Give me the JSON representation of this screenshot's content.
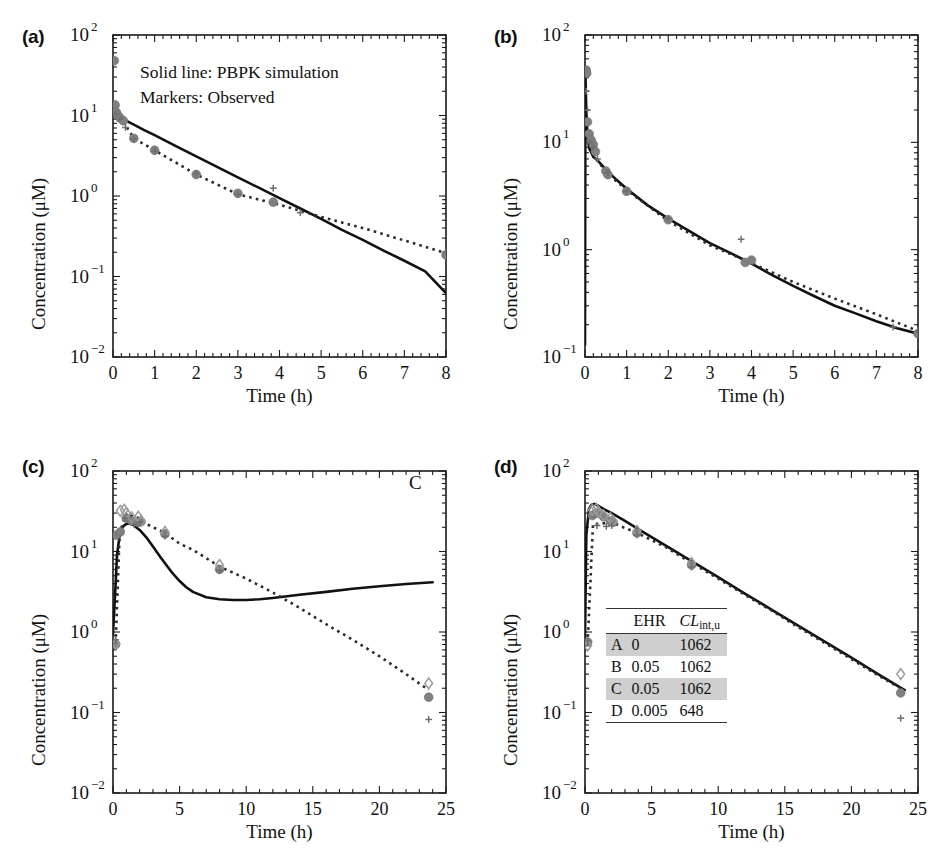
{
  "figure": {
    "panels": [
      {
        "id": "a",
        "label": "(a)",
        "xlabel": "Time (h)",
        "ylabel": "Concentration (μM)",
        "xlim": [
          0,
          8
        ],
        "ylim_exp": [
          -2,
          2
        ],
        "xticks": [
          0,
          1,
          2,
          3,
          4,
          5,
          6,
          7,
          8
        ],
        "xticklabels": [
          "0",
          "1",
          "2",
          "3",
          "4",
          "5",
          "6",
          "7",
          "8"
        ],
        "yticklabels": [
          "10⁻²",
          "10⁻¹",
          "10⁰",
          "10¹",
          "10²"
        ],
        "legend": [
          "Solid line: PBPK simulation",
          "Markers: Observed"
        ],
        "annotation": ""
      },
      {
        "id": "b",
        "label": "(b)",
        "xlabel": "Time (h)",
        "ylabel": "Concentration (μM)",
        "xlim": [
          0,
          8
        ],
        "ylim_exp": [
          -1,
          2
        ],
        "xticks": [
          0,
          1,
          2,
          3,
          4,
          5,
          6,
          7,
          8
        ],
        "xticklabels": [
          "0",
          "1",
          "2",
          "3",
          "4",
          "5",
          "6",
          "7",
          "8"
        ],
        "yticklabels": [
          "10⁻¹",
          "10⁰",
          "10¹",
          "10²"
        ],
        "legend": [],
        "annotation": ""
      },
      {
        "id": "c",
        "label": "(c)",
        "xlabel": "Time (h)",
        "ylabel": "Concentration (μM)",
        "xlim": [
          0,
          25
        ],
        "ylim_exp": [
          -2,
          2
        ],
        "xticks": [
          0,
          5,
          10,
          15,
          20,
          25
        ],
        "xticklabels": [
          "0",
          "5",
          "10",
          "15",
          "20",
          "25"
        ],
        "yticklabels": [
          "10⁻²",
          "10⁻¹",
          "10⁰",
          "10¹",
          "10²"
        ],
        "legend": [],
        "annotation": "C"
      },
      {
        "id": "d",
        "label": "(d)",
        "xlabel": "Time (h)",
        "ylabel": "Concentration (μM)",
        "xlim": [
          0,
          25
        ],
        "ylim_exp": [
          -2,
          2
        ],
        "xticks": [
          0,
          5,
          10,
          15,
          20,
          25
        ],
        "xticklabels": [
          "0",
          "5",
          "10",
          "15",
          "20",
          "25"
        ],
        "yticklabels": [
          "10⁻²",
          "10⁻¹",
          "10⁰",
          "10¹",
          "10²"
        ],
        "legend": [],
        "annotation": ""
      }
    ],
    "inset_table": {
      "columns": [
        "",
        "EHR",
        "CL_int,u"
      ],
      "col_headers": {
        "c1": "",
        "c2": "EHR",
        "c3_main": "CL",
        "c3_sub": "int,u"
      },
      "rows": [
        {
          "name": "A",
          "ehr": "0",
          "clintu": "1062",
          "shaded": true
        },
        {
          "name": "B",
          "ehr": "0.05",
          "clintu": "1062",
          "shaded": false
        },
        {
          "name": "C",
          "ehr": "0.05",
          "clintu": "1062",
          "shaded": true
        },
        {
          "name": "D",
          "ehr": "0.005",
          "clintu": "648",
          "shaded": false
        }
      ]
    },
    "colors": {
      "solid_line": "#111111",
      "dotted_line": "#2b2b2b",
      "marker_circle": "#808080",
      "marker_diamond": "#9a9a9a",
      "marker_plus": "#6e6e6e",
      "axis": "#1a1a1a",
      "table_shade": "#cfcfcf"
    }
  },
  "chart_data": [
    {
      "type": "line",
      "panel": "a",
      "title": "(a)",
      "xlabel": "Time (h)",
      "ylabel": "Concentration (μM)",
      "xlim": [
        0,
        8
      ],
      "ylim": [
        0.01,
        100
      ],
      "yscale": "log",
      "grid": false,
      "legend": [
        "Solid line: PBPK simulation",
        "Markers: Observed"
      ],
      "series": [
        {
          "name": "PBPK simulation (solid line)",
          "style": "solid",
          "x": [
            0,
            0.02,
            0.05,
            0.1,
            0.2,
            0.3,
            0.5,
            0.75,
            1,
            1.5,
            2,
            2.5,
            3,
            3.5,
            4,
            4.5,
            5,
            5.5,
            6,
            6.5,
            7,
            7.5,
            8
          ],
          "y": [
            11.0,
            10.6,
            10.2,
            9.8,
            9.2,
            8.7,
            7.7,
            6.6,
            5.7,
            4.2,
            3.1,
            2.3,
            1.7,
            1.27,
            0.94,
            0.7,
            0.52,
            0.38,
            0.285,
            0.21,
            0.157,
            0.116,
            0.062
          ]
        },
        {
          "name": "Observed trend (dotted line)",
          "style": "dotted",
          "x": [
            0.25,
            0.5,
            1,
            2,
            3,
            4,
            5,
            6,
            7,
            8
          ],
          "y": [
            8.4,
            5.2,
            3.7,
            1.85,
            1.05,
            0.78,
            0.55,
            0.4,
            0.28,
            0.195
          ]
        },
        {
          "name": "Observed (circle markers)",
          "style": "markers",
          "marker": "circle",
          "x": [
            0.03,
            0.05,
            0.08,
            0.12,
            0.17,
            0.25,
            0.5,
            1.0,
            2.0,
            3.0,
            3.85,
            8.0
          ],
          "y": [
            48.0,
            13.5,
            11.0,
            10.0,
            9.3,
            8.6,
            5.2,
            3.7,
            1.85,
            1.08,
            0.84,
            0.185
          ]
        },
        {
          "name": "Observed (plus markers)",
          "style": "markers",
          "marker": "plus",
          "x": [
            0.08,
            0.17,
            0.3,
            0.5,
            1.0,
            2.0,
            3.0,
            3.85,
            4.5,
            8.0
          ],
          "y": [
            10.5,
            9.1,
            7.1,
            5.1,
            3.6,
            1.9,
            1.05,
            1.25,
            0.62,
            0.2
          ]
        }
      ]
    },
    {
      "type": "line",
      "panel": "b",
      "title": "(b)",
      "xlabel": "Time (h)",
      "ylabel": "Concentration (μM)",
      "xlim": [
        0,
        8
      ],
      "ylim": [
        0.1,
        100
      ],
      "yscale": "log",
      "grid": false,
      "legend": [],
      "series": [
        {
          "name": "PBPK simulation (solid line)",
          "style": "solid",
          "x": [
            0,
            0.01,
            0.03,
            0.06,
            0.1,
            0.2,
            0.3,
            0.5,
            0.75,
            1,
            1.5,
            2,
            2.5,
            3,
            3.5,
            4,
            4.5,
            5,
            5.5,
            6,
            6.5,
            7,
            7.5,
            8
          ],
          "y": [
            0.13,
            45.0,
            20.0,
            11.5,
            8.8,
            7.3,
            6.8,
            5.6,
            4.5,
            3.7,
            2.6,
            1.95,
            1.5,
            1.15,
            0.93,
            0.74,
            0.58,
            0.46,
            0.37,
            0.3,
            0.255,
            0.215,
            0.185,
            0.165
          ]
        },
        {
          "name": "Observed trend (dotted line)",
          "style": "dotted",
          "x": [
            0.05,
            0.25,
            0.5,
            1,
            2,
            3,
            4,
            5,
            6,
            7,
            8
          ],
          "y": [
            12.0,
            7.2,
            5.3,
            3.6,
            1.85,
            1.1,
            0.75,
            0.5,
            0.35,
            0.25,
            0.175
          ]
        },
        {
          "name": "Observed (circle markers)",
          "style": "markers",
          "marker": "circle",
          "x": [
            0.03,
            0.04,
            0.06,
            0.1,
            0.15,
            0.2,
            0.25,
            0.5,
            0.55,
            1.0,
            2.0,
            3.85,
            4.0,
            8.0
          ],
          "y": [
            47.0,
            44.0,
            15.5,
            12.0,
            10.5,
            9.5,
            8.2,
            5.4,
            5.0,
            3.5,
            1.9,
            0.76,
            0.8,
            0.165
          ]
        },
        {
          "name": "Observed (plus markers)",
          "style": "markers",
          "marker": "plus",
          "x": [
            0.03,
            0.06,
            0.12,
            0.2,
            0.3,
            0.55,
            1.0,
            2.0,
            3.75,
            7.4,
            8.0
          ],
          "y": [
            30.0,
            20.0,
            10.0,
            9.0,
            7.0,
            5.2,
            3.5,
            1.95,
            1.25,
            0.19,
            0.175
          ]
        }
      ]
    },
    {
      "type": "line",
      "panel": "c",
      "title": "(c)",
      "xlabel": "Time (h)",
      "ylabel": "Concentration (μM)",
      "xlim": [
        0,
        25
      ],
      "ylim": [
        0.01,
        100
      ],
      "yscale": "log",
      "grid": false,
      "legend": [],
      "annotation": "C",
      "series": [
        {
          "name": "PBPK simulation (solid line)",
          "style": "solid",
          "x": [
            0,
            0.15,
            0.3,
            0.5,
            0.75,
            1.0,
            1.25,
            1.5,
            2,
            2.5,
            3,
            3.5,
            4,
            4.5,
            5,
            5.5,
            6,
            7,
            8,
            9,
            10,
            11,
            12,
            14,
            16,
            18,
            20,
            22,
            24
          ],
          "y": [
            0.95,
            2.8,
            9.0,
            16.0,
            20.5,
            22.0,
            22.3,
            21.5,
            18.5,
            15.0,
            11.5,
            8.8,
            6.8,
            5.3,
            4.3,
            3.6,
            3.15,
            2.7,
            2.55,
            2.5,
            2.5,
            2.55,
            2.65,
            2.9,
            3.15,
            3.45,
            3.7,
            3.95,
            4.15
          ]
        },
        {
          "name": "Observed trend (dotted line)",
          "style": "dotted",
          "x": [
            0.2,
            0.5,
            1.0,
            1.5,
            2.0,
            2.5,
            3.9,
            5,
            6,
            8,
            10,
            12,
            14,
            16,
            18,
            20,
            22,
            23.7
          ],
          "y": [
            0.72,
            17.0,
            30.0,
            27.0,
            26.0,
            22.0,
            17.0,
            12.5,
            10.5,
            6.5,
            4.6,
            3.1,
            2.0,
            1.25,
            0.8,
            0.5,
            0.3,
            0.19
          ]
        },
        {
          "name": "Observed (circle markers)",
          "style": "markers",
          "marker": "circle",
          "x": [
            0.2,
            0.25,
            0.55,
            1.0,
            1.4,
            1.9,
            2.1,
            3.9,
            8.0,
            23.7
          ],
          "y": [
            0.7,
            16.0,
            17.5,
            26.0,
            24.0,
            23.0,
            23.5,
            16.5,
            6.0,
            0.155
          ]
        },
        {
          "name": "Observed (diamond markers)",
          "style": "markers",
          "marker": "diamond",
          "x": [
            0.2,
            0.55,
            0.85,
            1.0,
            1.4,
            1.9,
            2.1,
            3.9,
            8.0,
            23.7
          ],
          "y": [
            0.72,
            32.0,
            33.0,
            30.0,
            26.5,
            27.0,
            24.0,
            17.5,
            6.8,
            0.23
          ]
        },
        {
          "name": "Observed (plus markers)",
          "style": "markers",
          "marker": "plus",
          "x": [
            0.2,
            0.9,
            1.6,
            2.0,
            3.9,
            8.0,
            23.7
          ],
          "y": [
            0.8,
            26.0,
            21.5,
            23.0,
            15.5,
            5.8,
            0.082
          ]
        }
      ]
    },
    {
      "type": "line",
      "panel": "d",
      "title": "(d)",
      "xlabel": "Time (h)",
      "ylabel": "Concentration (μM)",
      "xlim": [
        0,
        25
      ],
      "ylim": [
        0.01,
        100
      ],
      "yscale": "log",
      "grid": false,
      "legend": [],
      "series": [
        {
          "name": "PBPK simulation (solid line)",
          "style": "solid",
          "x": [
            0,
            0.1,
            0.3,
            0.5,
            0.7,
            1.0,
            1.5,
            2,
            3,
            4,
            6,
            8,
            10,
            12,
            14,
            16,
            18,
            20,
            22,
            24
          ],
          "y": [
            0.8,
            16.0,
            34.0,
            38.0,
            39.0,
            37.0,
            33.0,
            30.0,
            24.0,
            19.0,
            12.0,
            7.6,
            4.8,
            3.0,
            1.9,
            1.2,
            0.76,
            0.48,
            0.3,
            0.19
          ]
        },
        {
          "name": "Observed trend (dotted line)",
          "style": "dotted",
          "x": [
            0.2,
            0.6,
            1.0,
            2.0,
            3.9,
            6,
            8,
            10,
            12,
            14,
            16,
            18,
            20,
            22,
            23.7
          ],
          "y": [
            0.72,
            22.0,
            22.0,
            23.0,
            17.0,
            11.5,
            7.2,
            4.6,
            2.9,
            1.85,
            1.15,
            0.73,
            0.46,
            0.29,
            0.2
          ]
        },
        {
          "name": "Observed (circle markers)",
          "style": "markers",
          "marker": "circle",
          "x": [
            0.2,
            0.55,
            0.85,
            1.0,
            1.4,
            1.9,
            2.1,
            3.9,
            8.0,
            23.7
          ],
          "y": [
            0.75,
            28.0,
            30.0,
            30.0,
            27.0,
            24.0,
            23.0,
            17.0,
            6.8,
            0.175
          ]
        },
        {
          "name": "Observed (diamond markers)",
          "style": "markers",
          "marker": "diamond",
          "x": [
            0.2,
            0.55,
            0.85,
            1.0,
            1.4,
            1.9,
            2.1,
            3.9,
            8.0,
            23.7
          ],
          "y": [
            0.68,
            33.0,
            34.0,
            31.0,
            28.0,
            26.0,
            24.0,
            18.0,
            7.2,
            0.3
          ]
        },
        {
          "name": "Observed (plus markers)",
          "style": "markers",
          "marker": "plus",
          "x": [
            0.2,
            0.9,
            1.6,
            2.0,
            3.9,
            8.0,
            23.7
          ],
          "y": [
            0.78,
            21.0,
            20.5,
            21.0,
            16.0,
            6.4,
            0.085
          ]
        }
      ]
    }
  ]
}
